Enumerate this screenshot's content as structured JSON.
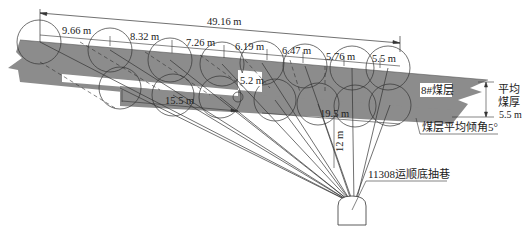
{
  "diagram": {
    "type": "coal-seam-drilling-layout",
    "colors": {
      "seam_fill": "#8c8c8c",
      "line": "#333333",
      "background": "#ffffff"
    },
    "total_length": "49.16 m",
    "top_spacings": [
      "9.66 m",
      "8.32 m",
      "7.26 m",
      "6.19 m",
      "6.47 m",
      "5.76 m",
      "5.5 m"
    ],
    "bottom_spacings": [
      "15.5 m",
      "19.5 m"
    ],
    "mid_spacing": "5.2 m",
    "vertical_distance": "12 m",
    "seam_label": "8#煤层",
    "thickness_label_line1": "平均",
    "thickness_label_line2": "煤厚",
    "thickness_value": "5.5 m",
    "dip_label": "煤层平均倾角5°",
    "roadway_label": "11308运顺底抽巷"
  }
}
